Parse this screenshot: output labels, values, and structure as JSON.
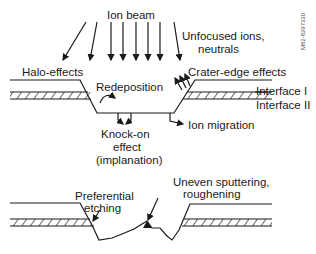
{
  "diagram": {
    "top_panel": {
      "labels": {
        "ion_beam": "Ion beam",
        "unfocused_1": "Unfocused ions,",
        "unfocused_2": "neutrals",
        "halo": "Halo-effects",
        "crater_edge": "Crater-edge effects",
        "redeposition": "Redeposition",
        "interface_1": "Interface I",
        "interface_2": "Interface II",
        "knock_on_1": "Knock-on",
        "knock_on_2": "effect",
        "knock_on_3": "(implanation)",
        "ion_migration": "Ion migration"
      }
    },
    "bottom_panel": {
      "labels": {
        "preferential_1": "Preferential",
        "preferential_2": "etching",
        "uneven_1": "Uneven sputtering,",
        "uneven_2": "roughening"
      }
    },
    "figure_id": "M82-8297330"
  }
}
